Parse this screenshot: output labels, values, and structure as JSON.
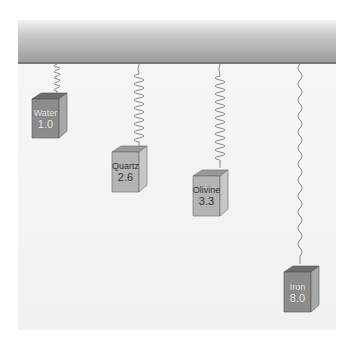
{
  "diagram": {
    "colors": {
      "ceiling_dark": "#9a9a9a",
      "ceiling_light": "#f2f2f2",
      "spring": "#8a8a8a",
      "cube_front": "#8c8c8c",
      "cube_side": "#a8a8a8",
      "cube_top": "#6e6e6e",
      "cube_front_light": "#b4b4b4",
      "cube_side_light": "#c8c8c8",
      "cube_top_light": "#9a9a9a"
    },
    "items": [
      {
        "name": "Water",
        "value": "1.0"
      },
      {
        "name": "Quartz",
        "value": "2.6"
      },
      {
        "name": "Olivine",
        "value": "3.3"
      },
      {
        "name": "Iron",
        "value": "8.0"
      }
    ]
  }
}
